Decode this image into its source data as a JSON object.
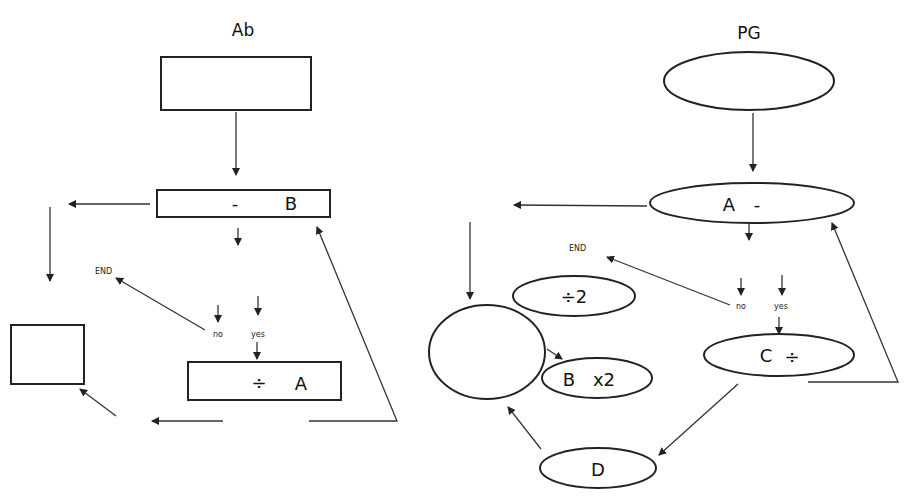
{
  "diagrams": [
    {
      "title": "Ab",
      "nodes": {
        "start": {
          "label": ""
        },
        "subtract_b": {
          "op": "-",
          "operand": "B"
        },
        "decision": {
          "no": "no",
          "yes": "yes"
        },
        "end": {
          "label": "END"
        },
        "divide_a": {
          "op": "÷",
          "operand": "A"
        },
        "output": {
          "label": ""
        }
      },
      "shape": "rectangle"
    },
    {
      "title": "PG",
      "nodes": {
        "start": {
          "label": ""
        },
        "a_subtract": {
          "operand": "A",
          "op": "-"
        },
        "decision": {
          "no": "no",
          "yes": "yes"
        },
        "end": {
          "label": "END"
        },
        "c_divide": {
          "operand": "C",
          "op": "÷"
        },
        "circle": {
          "label": ""
        },
        "divide_2": {
          "label": "÷2"
        },
        "b_times_2": {
          "operand": "B",
          "op": "x2"
        },
        "d": {
          "label": "D"
        }
      },
      "shape": "ellipse"
    }
  ],
  "colors": {
    "stroke": "#222222",
    "background": "#ffffff"
  }
}
